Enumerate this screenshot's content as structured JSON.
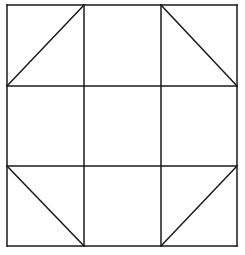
{
  "diagram": {
    "stroke_color": "#1a1a1a",
    "background": "#ffffff",
    "grid": {
      "x": [
        7,
        84,
        161,
        237
      ],
      "y": [
        5,
        86,
        166,
        246
      ]
    },
    "diagonals": [
      {
        "cell": "top-left",
        "from": [
          7,
          86
        ],
        "to": [
          84,
          5
        ]
      },
      {
        "cell": "top-right",
        "from": [
          161,
          5
        ],
        "to": [
          237,
          86
        ]
      },
      {
        "cell": "bottom-left",
        "from": [
          7,
          166
        ],
        "to": [
          84,
          246
        ]
      },
      {
        "cell": "bottom-right",
        "from": [
          161,
          246
        ],
        "to": [
          237,
          166
        ]
      }
    ]
  }
}
